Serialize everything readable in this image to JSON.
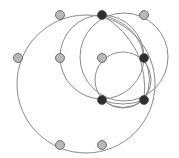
{
  "diagram": {
    "type": "circle-arrangement",
    "colors": {
      "background": "#ffffff",
      "curve": "#8a8a8a",
      "node_light": "#b8b8b8",
      "node_dark": "#2e2e2e",
      "node_stroke": "#555555"
    },
    "nodes": [
      {
        "id": "A",
        "x": 60,
        "y": 15,
        "kind": "light"
      },
      {
        "id": "B",
        "x": 102,
        "y": 15,
        "kind": "dark"
      },
      {
        "id": "C",
        "x": 144,
        "y": 15,
        "kind": "light"
      },
      {
        "id": "D",
        "x": 18,
        "y": 58,
        "kind": "light"
      },
      {
        "id": "E",
        "x": 60,
        "y": 58,
        "kind": "light"
      },
      {
        "id": "F",
        "x": 102,
        "y": 58,
        "kind": "light"
      },
      {
        "id": "G",
        "x": 144,
        "y": 58,
        "kind": "dark"
      },
      {
        "id": "H",
        "x": 102,
        "y": 100,
        "kind": "dark"
      },
      {
        "id": "I",
        "x": 144,
        "y": 100,
        "kind": "dark"
      },
      {
        "id": "J",
        "x": 60,
        "y": 145,
        "kind": "light"
      },
      {
        "id": "K",
        "x": 102,
        "y": 145,
        "kind": "light"
      }
    ],
    "circles": [
      {
        "id": "outer",
        "cx": 86,
        "cy": 84,
        "r": 69
      },
      {
        "id": "mid-left",
        "cx": 102,
        "cy": 57,
        "r": 42
      },
      {
        "id": "mid-right",
        "cx": 124,
        "cy": 57,
        "r": 44
      },
      {
        "id": "small",
        "cx": 123,
        "cy": 80,
        "r": 28
      }
    ],
    "arcs": [
      {
        "id": "B-G-upper",
        "d": "M102,15 Q140,25 144,58"
      },
      {
        "id": "B-I-inner",
        "d": "M102,15 Q150,45 144,100"
      },
      {
        "id": "H-I-lower",
        "d": "M102,100 Q123,115 144,100"
      },
      {
        "id": "H-I-lens",
        "d": "M102,100 Q123,108 144,100"
      },
      {
        "id": "G-I-right",
        "d": "M144,58 Q155,80 144,100"
      }
    ]
  }
}
